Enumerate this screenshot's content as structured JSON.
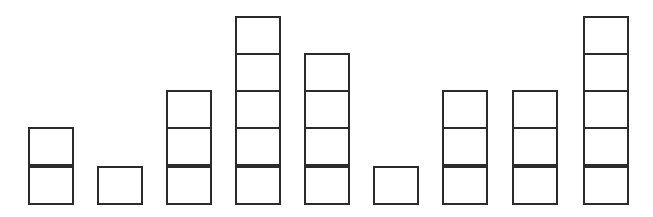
{
  "chart_data": {
    "type": "bar",
    "title": "",
    "subtitle": "",
    "xlabel": "",
    "ylabel": "",
    "grid": false,
    "legend": false,
    "legend_position": "none",
    "style": "unit-block pictograph (stacked unit squares, outlined, unfilled)",
    "unit_value": 1,
    "ylim": [
      0,
      5
    ],
    "categories": [
      "1",
      "2",
      "3",
      "4",
      "5",
      "6",
      "7",
      "8",
      "9"
    ],
    "values": [
      2,
      1,
      3,
      5,
      4,
      1,
      3,
      3,
      5
    ],
    "tick_labels": [],
    "annotations": [],
    "colors": {
      "background": "#ffffff",
      "stroke": "#2b2b2b",
      "fill": "#ffffff"
    }
  },
  "geometry": {
    "canvas_width": 653,
    "canvas_height": 217,
    "baseline_y": 205,
    "cell_width": 46,
    "cell_height": 39,
    "stroke_width": 2,
    "columns": [
      {
        "name": "column-1",
        "x": 28,
        "units": 2
      },
      {
        "name": "column-2",
        "x": 97,
        "units": 1
      },
      {
        "name": "column-3",
        "x": 166,
        "units": 3
      },
      {
        "name": "column-4",
        "x": 235,
        "units": 5
      },
      {
        "name": "column-5",
        "x": 304,
        "units": 4
      },
      {
        "name": "column-6",
        "x": 373,
        "units": 1
      },
      {
        "name": "column-7",
        "x": 442,
        "units": 3
      },
      {
        "name": "column-8",
        "x": 512,
        "units": 3
      },
      {
        "name": "column-9",
        "x": 583,
        "units": 5
      }
    ]
  }
}
